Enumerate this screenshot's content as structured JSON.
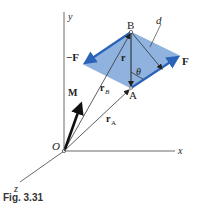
{
  "figure": {
    "caption": "Fig. 3.31",
    "colors": {
      "plane_fill": "#8fb3de",
      "force_vector": "#2b63b8",
      "line": "#333333",
      "moment_vector": "#111111"
    },
    "axes": {
      "x_label": "x",
      "y_label": "y",
      "z_label": "z",
      "origin_label": "O"
    },
    "points": {
      "A_label": "A",
      "B_label": "B"
    },
    "vectors": {
      "force_pos_label": "F",
      "force_neg_label": "−F",
      "moment_label": "M",
      "r_label": "r",
      "rA_label": "r",
      "rA_sub": "A",
      "rB_label": "r",
      "rB_sub": "B"
    },
    "annotations": {
      "distance_label": "d",
      "angle_label": "θ"
    }
  }
}
